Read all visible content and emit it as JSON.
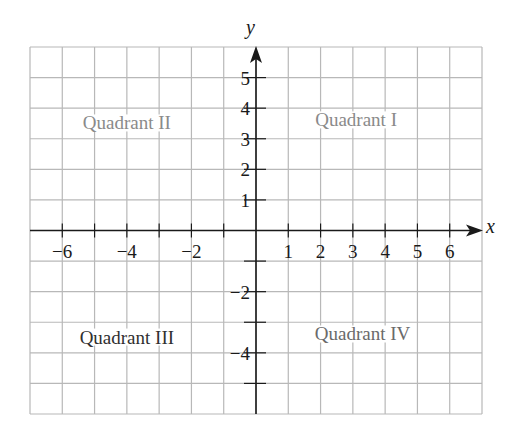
{
  "chart_data": {
    "type": "scatter",
    "title": "",
    "xlabel": "x",
    "ylabel": "y",
    "xlim": [
      -7,
      7
    ],
    "ylim": [
      -6,
      6
    ],
    "grid": true,
    "x_tick_labels": [
      "−6",
      "−4",
      "−2",
      "1",
      "2",
      "3",
      "4",
      "5",
      "6"
    ],
    "x_tick_values": [
      -6,
      -4,
      -2,
      1,
      2,
      3,
      4,
      5,
      6
    ],
    "y_tick_labels": [
      "5",
      "4",
      "3",
      "2",
      "1",
      "−2",
      "−4"
    ],
    "y_tick_values": [
      5,
      4,
      3,
      2,
      1,
      -2,
      -4
    ],
    "x_ticks_marked": [
      -6,
      -5,
      -4,
      -3,
      -2,
      -1,
      1,
      2,
      3,
      4,
      5,
      6
    ],
    "y_ticks_marked": [
      5,
      4,
      3,
      2,
      1,
      -1,
      -2,
      -3,
      -4,
      -5
    ],
    "annotations": [
      {
        "text": "Quadrant I",
        "x": 3.1,
        "y": 3.6,
        "color": "#8a8a8a"
      },
      {
        "text": "Quadrant II",
        "x": -4.0,
        "y": 3.5,
        "color": "#8a8a8a"
      },
      {
        "text": "Quadrant III",
        "x": -4.0,
        "y": -3.5,
        "color": "#2f2f2f"
      },
      {
        "text": "Quadrant IV",
        "x": 3.3,
        "y": -3.4,
        "color": "#6a6a6a"
      }
    ],
    "series": []
  },
  "axes": {
    "x_label": "x",
    "y_label": "y"
  },
  "colors": {
    "grid": "#b8b8b8",
    "axis": "#1a1a1a",
    "tick_text": "#1a1a1a"
  }
}
